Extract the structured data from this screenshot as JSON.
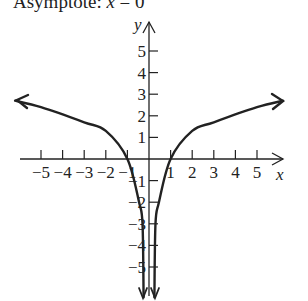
{
  "caption": {
    "prefix": "Asymptote: ",
    "variable": "x",
    "suffix": " = 0"
  },
  "chart_data": {
    "type": "line",
    "title": "Asymptote: x = 0",
    "xlabel": "x",
    "ylabel": "y",
    "xlim": [
      -6,
      6
    ],
    "ylim": [
      -6,
      6
    ],
    "grid": false,
    "x_ticks": [
      -5,
      -4,
      -3,
      -2,
      -1,
      1,
      2,
      3,
      4,
      5
    ],
    "y_ticks": [
      -5,
      -4,
      -3,
      -2,
      -1,
      1,
      2,
      3,
      4,
      5
    ],
    "x_tick_labels": [
      "−5",
      "−4",
      "−3",
      "−2",
      "−1",
      "1",
      "2",
      "3",
      "4",
      "5"
    ],
    "y_tick_labels": [
      "5",
      "4",
      "3",
      "2",
      "1",
      "−1",
      "−2",
      "−3",
      "−4",
      "−5"
    ],
    "series": [
      {
        "name": "left branch",
        "x": [
          -6.2,
          -5,
          -3,
          -2,
          -1,
          -0.46,
          -0.3,
          -0.25
        ],
        "y": [
          2.7,
          2.4,
          1.7,
          1.3,
          0,
          -2.0,
          -3.0,
          -6.4
        ]
      },
      {
        "name": "right branch",
        "x": [
          0.25,
          0.3,
          0.46,
          1,
          2,
          3,
          5,
          6.2
        ],
        "y": [
          -6.4,
          -3.0,
          -2.0,
          0,
          1.3,
          1.7,
          2.4,
          2.7
        ]
      }
    ],
    "asymptote": "x = 0",
    "x_intercepts": [
      -1,
      1
    ]
  }
}
